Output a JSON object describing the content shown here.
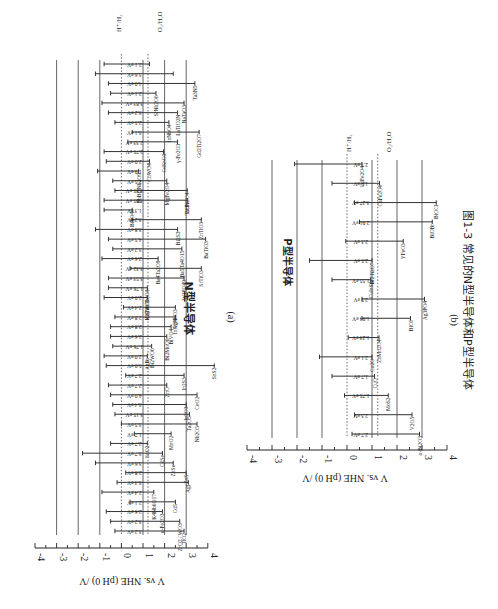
{
  "figure": {
    "caption": "图1-3 常见的N型半导体和P型半导体",
    "orientation": "rotated 90deg clockwise on page",
    "colors": {
      "line": "#333333",
      "grid": "#555555",
      "background": "#ffffff"
    }
  },
  "chart_data": [
    {
      "type": "bar",
      "subtype": "floating band-edge bars",
      "panel_label": "(a)",
      "title": "N型半导体",
      "ylabel": "V vs. NHE (pH 0) /V",
      "ylim": [
        -4,
        4
      ],
      "yticks": [
        "-4",
        "-3",
        "-2",
        "-1",
        "0",
        "1",
        "2",
        "3",
        "4"
      ],
      "grid": "horizontal lines at -3,-2,-1,1,2,3",
      "reference_lines": [
        {
          "label": "H⁺/H₂",
          "value": 0,
          "style": "dotted"
        },
        {
          "label": "O₂/H₂O",
          "value": 1.23,
          "style": "dotted"
        }
      ],
      "categories": [
        "TiO2",
        "ZrO2 / WO3",
        "α-Fe2O3",
        "CdS",
        "K4Nb6O17",
        "AgI",
        "ZnS",
        "ZnSe",
        "CdSe",
        "SnO2",
        "MnO2",
        "Nb2O5",
        "Ta2O5",
        "In2O3",
        "CeO2",
        "ZnO",
        "In2S3",
        "SnS2",
        "AgBr",
        "Bi2WO6",
        "Bi2MoO6",
        "BiVO4",
        "InVO4",
        "AgNbO3",
        "K2Ti4O9",
        "In(Nb/Ta)O4",
        "W18O49",
        "SrTiO3",
        "Ba4Ta2O9",
        "Ba5Ta4O15",
        "BaTiO3",
        "Bi2S3",
        "ZnTiO3",
        "BiPO4",
        "TaON",
        "ZnFe2O4",
        "MgFe2O4",
        "PbBi2Nb2O9",
        "CuWO4",
        "CdSnO3",
        "γ-Fe2O3",
        "Gd2Ti2O7",
        "InNbO4",
        "LaTiO2N",
        "NaTaO3",
        "SrNb2O6",
        "Ta3N5"
      ],
      "band_gap_labels": [
        "3.2 eV",
        "3.2 eV",
        "2.6 eV",
        "2.1 eV",
        "2.4 eV",
        "3.3 eV",
        "2.8 eV",
        "3.6 eV",
        "3.7 eV",
        "2.7 eV",
        "1.7 eV",
        "3.5 eV",
        "3.15 eV",
        "3.4 eV",
        "4.0 eV",
        "2.7 eV",
        "2.7 eV",
        "5.0 eV",
        "2.0 eV",
        "1.76 eV",
        "2.6 eV",
        "2.8 eV",
        "2.8 eV",
        "2.4 eV",
        "2.0 eV",
        "1.76 eV",
        "3.53 eV",
        "3.32 eV",
        "2.6 eV",
        "3.2 eV",
        "4.5 eV",
        "3.8 eV",
        "3.2 eV",
        "1.3 eV",
        "3.85 eV",
        "3.85 eV",
        "2.5 eV",
        "1.9 eV",
        "2.0 eV",
        "2.75 eV",
        "2.33 eV",
        "3.1 eV",
        "2.5 eV",
        "3.2 eV",
        "3.83 eV",
        "2.1 eV",
        "4.0 eV",
        "3.6 eV",
        "2.1 eV"
      ],
      "series": [
        {
          "name": "conduction band (V)",
          "values": [
            -0.3,
            -0.5,
            -0.7,
            0.4,
            -0.9,
            -0.2,
            0.2,
            -1.2,
            -1.8,
            -0.5,
            0.6,
            0.0,
            -0.3,
            -0.4,
            -0.5,
            -0.6,
            0.2,
            -0.7,
            -0.8,
            -0.4,
            -0.5,
            -0.5,
            -0.3,
            0.1,
            -0.8,
            -0.6,
            -0.6,
            0.4,
            -0.9,
            -0.4,
            -0.6,
            -1.2,
            0.5,
            -0.8,
            -0.8,
            -0.3,
            -0.4,
            -1.1,
            -0.7,
            -0.8,
            0.3,
            0.5,
            -0.3,
            -0.6,
            -0.9,
            -0.5,
            -0.6,
            -1.2,
            -0.8
          ]
        },
        {
          "name": "valence band (V)",
          "values": [
            2.9,
            2.7,
            1.9,
            2.5,
            1.5,
            3.1,
            3.0,
            2.4,
            1.9,
            1.2,
            2.3,
            3.5,
            3.15,
            3.0,
            3.5,
            2.1,
            2.9,
            4.3,
            1.2,
            1.4,
            2.1,
            2.3,
            2.5,
            2.5,
            1.2,
            1.2,
            2.9,
            3.7,
            1.7,
            2.8,
            3.9,
            2.6,
            3.7,
            0.5,
            3.05,
            3.05,
            2.1,
            0.8,
            1.3,
            1.95,
            2.6,
            3.6,
            2.2,
            2.6,
            2.9,
            1.6,
            3.4,
            2.4,
            1.3
          ]
        }
      ]
    },
    {
      "type": "bar",
      "subtype": "floating band-edge bars",
      "panel_label": "(b)",
      "title": "P型半导体",
      "ylabel": "V vs. NHE (pH 0) /V",
      "ylim": [
        -4,
        4
      ],
      "yticks": [
        "-4",
        "-3",
        "-2",
        "-1",
        "0",
        "1",
        "2",
        "3",
        "4"
      ],
      "grid": "horizontal lines at -3,-2,-1,1,2,3",
      "reference_lines": [
        {
          "label": "H⁺/H₂",
          "value": 0,
          "style": "dotted"
        },
        {
          "label": "O₂/H₂O",
          "value": 1.23,
          "style": "dotted"
        }
      ],
      "categories": [
        "α-Bi2O3",
        "V2O5",
        "MoS2",
        "CuO",
        "Cu2O",
        "ZnMn2O4",
        "BiOI",
        "Ag3PO4",
        "CuInS2",
        "Bi2Ti2O7",
        "YFeO3",
        "BiOBr",
        "BiOCl",
        "CaFe2O4",
        "CdFe2O4"
      ],
      "band_gap_labels": [
        "2.7 eV",
        "2.3 eV",
        "1.75 eV",
        "1.7 eV",
        "2.1 eV",
        "1.23 eV",
        "1.94 eV",
        "2.5 eV",
        "1.55 eV",
        "2.5 eV",
        "2.3 eV",
        "2.91 eV",
        "3.27 eV",
        "1.9 eV",
        "2.7 eV"
      ],
      "series": [
        {
          "name": "conduction band (V)",
          "values": [
            0.2,
            0.3,
            -0.1,
            -0.6,
            -1.1,
            0.05,
            0.6,
            0.6,
            -0.6,
            -1.5,
            -0.05,
            0.5,
            0.3,
            -0.6,
            -2.1
          ]
        },
        {
          "name": "valence band (V)",
          "values": [
            2.9,
            2.6,
            1.65,
            1.1,
            1.0,
            1.28,
            2.54,
            3.1,
            0.95,
            1.0,
            2.25,
            3.41,
            3.57,
            1.3,
            0.6
          ]
        }
      ]
    }
  ],
  "panel_a": {
    "title": "N型半导体",
    "label": "(a)",
    "axis_label": "V vs. NHE (pH 0) /V",
    "ticks": [
      "-4",
      "-3",
      "-2",
      "-1",
      "0",
      "1",
      "2",
      "3",
      "4"
    ],
    "ref_h": "H⁺/H₂",
    "ref_o": "O₂/H₂O"
  },
  "panel_b": {
    "title": "P型半导体",
    "label": "(b)",
    "axis_label": "V vs. NHE (pH 0) /V",
    "ticks": [
      "-4",
      "-3",
      "-2",
      "-1",
      "0",
      "1",
      "2",
      "3",
      "4"
    ],
    "ref_h": "H⁺/H₂",
    "ref_o": "O₂/H₂O"
  }
}
